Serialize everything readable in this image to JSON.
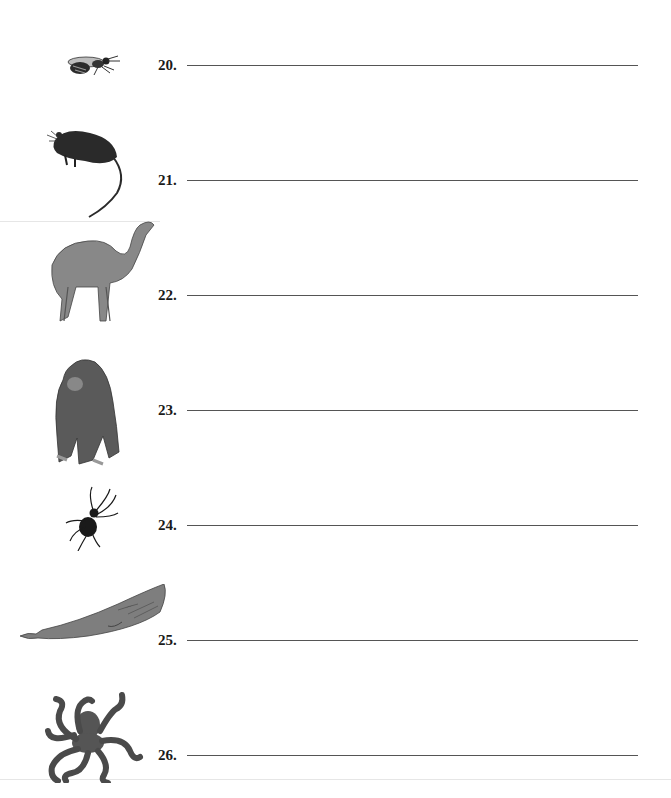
{
  "worksheet": {
    "items": [
      {
        "number": "20.",
        "animal_icon": "bee-icon",
        "answer": ""
      },
      {
        "number": "21.",
        "animal_icon": "rat-icon",
        "answer": ""
      },
      {
        "number": "22.",
        "animal_icon": "camel-icon",
        "answer": ""
      },
      {
        "number": "23.",
        "animal_icon": "gorilla-icon",
        "answer": ""
      },
      {
        "number": "24.",
        "animal_icon": "spider-icon",
        "answer": ""
      },
      {
        "number": "25.",
        "animal_icon": "whale-icon",
        "answer": ""
      },
      {
        "number": "26.",
        "animal_icon": "octopus-icon",
        "answer": ""
      }
    ]
  },
  "colors": {
    "ink": "#1a1a1a",
    "line": "#555555",
    "animal_gray": "#7a7a7a",
    "animal_dark": "#3a3a3a"
  }
}
